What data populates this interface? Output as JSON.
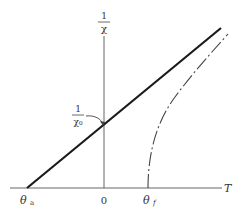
{
  "diagram": {
    "title": "",
    "y_axis": {
      "label_numerator": "1",
      "label_denominator": "χ"
    },
    "x_axis": {
      "label": "T"
    },
    "annotations": {
      "intercept_label_numerator": "1",
      "intercept_label_denominator": "χ₀",
      "theta_a": "θ",
      "theta_a_sub": "a",
      "origin": "0",
      "theta_f": "θ",
      "theta_f_sub": "f"
    },
    "curves": [
      {
        "name": "straight-line",
        "style": "solid",
        "description": "linear 1/χ vs T, intercepting T-axis at θa (negative) and 1/χ-axis at 1/χ0"
      },
      {
        "name": "curved-line",
        "style": "dash-dot",
        "description": "curve starting at θf on T-axis, rising and approaching the straight line asymptotically"
      }
    ],
    "colors": {
      "line": "#1a1a1a",
      "axis": "#555555",
      "text": "#333333"
    }
  }
}
